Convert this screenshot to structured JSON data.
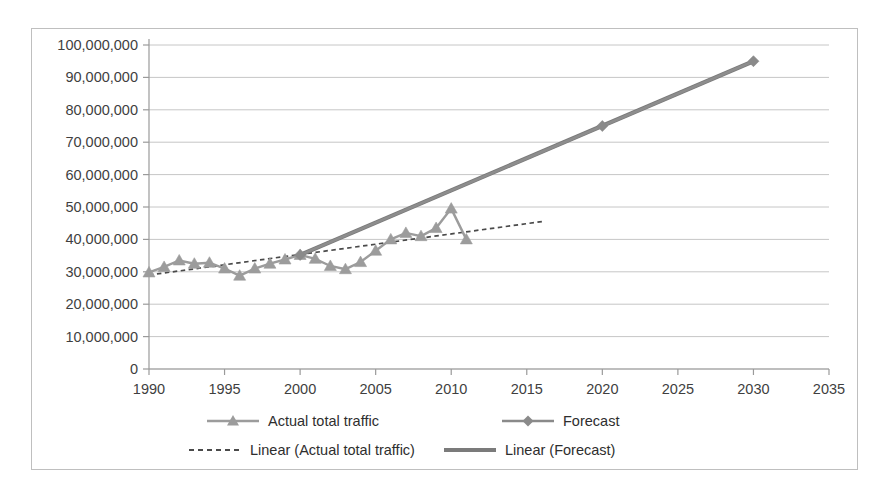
{
  "chart_data": {
    "type": "line",
    "title": "",
    "subtitle": "",
    "xlabel": "",
    "ylabel": "",
    "xlim": [
      1990,
      2035
    ],
    "ylim": [
      0,
      100000000
    ],
    "grid": true,
    "grid_axis": "y",
    "legend_position": "bottom",
    "x_ticks": [
      1990,
      1995,
      2000,
      2005,
      2010,
      2015,
      2020,
      2025,
      2030,
      2035
    ],
    "x_tick_labels": [
      "1990",
      "1995",
      "2000",
      "2005",
      "2010",
      "2015",
      "2020",
      "2025",
      "2030",
      "2035"
    ],
    "y_ticks": [
      0,
      10000000,
      20000000,
      30000000,
      40000000,
      50000000,
      60000000,
      70000000,
      80000000,
      90000000,
      100000000
    ],
    "y_tick_labels": [
      "0",
      "10,000,000",
      "20,000,000",
      "30,000,000",
      "40,000,000",
      "50,000,000",
      "60,000,000",
      "70,000,000",
      "80,000,000",
      "90,000,000",
      "100,000,000"
    ],
    "series": [
      {
        "name": "Actual total traffic",
        "style": "line-markers",
        "marker": "triangle",
        "color": "#9c9c9c",
        "x": [
          1990,
          1991,
          1992,
          1993,
          1994,
          1995,
          1996,
          1997,
          1998,
          1999,
          2000,
          2001,
          2002,
          2003,
          2004,
          2005,
          2006,
          2007,
          2008,
          2009,
          2010,
          2011
        ],
        "values": [
          29800000,
          31500000,
          33500000,
          32500000,
          32800000,
          31000000,
          28800000,
          31000000,
          32500000,
          33800000,
          35200000,
          34000000,
          31800000,
          30800000,
          33000000,
          36500000,
          40000000,
          42000000,
          41000000,
          43500000,
          49500000,
          40000000
        ]
      },
      {
        "name": "Forecast",
        "style": "line-markers",
        "marker": "diamond",
        "color": "#8a8a8a",
        "x": [
          2000,
          2020,
          2030
        ],
        "values": [
          35200000,
          75000000,
          95000000
        ]
      },
      {
        "name": "Linear (Actual total traffic)",
        "style": "dotted-trendline",
        "color": "#4a4a4a",
        "x": [
          1990,
          2016
        ],
        "values": [
          29000000,
          45500000
        ]
      },
      {
        "name": "Linear (Forecast)",
        "style": "thick-trendline",
        "color": "#7b7b7b",
        "x": [
          2000,
          2030
        ],
        "values": [
          35200000,
          95000000
        ]
      }
    ],
    "legend": [
      {
        "label": "Actual total traffic",
        "marker": "triangle",
        "line": "solid",
        "color": "#9c9c9c"
      },
      {
        "label": "Forecast",
        "marker": "diamond",
        "line": "solid",
        "color": "#8a8a8a"
      },
      {
        "label": "Linear (Actual total traffic)",
        "marker": "none",
        "line": "dotted",
        "color": "#4a4a4a"
      },
      {
        "label": "Linear (Forecast)",
        "marker": "none",
        "line": "thick-solid",
        "color": "#7b7b7b"
      }
    ]
  }
}
